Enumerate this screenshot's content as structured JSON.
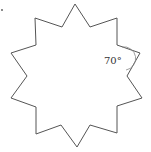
{
  "figure": {
    "type": "star-polygon",
    "points_count": 10,
    "stroke_color": "#555555",
    "background": "#ffffff",
    "angle_label": "70°",
    "vertices": [
      [
        75,
        4
      ],
      [
        90,
        27
      ],
      [
        117,
        18
      ],
      [
        117,
        45
      ],
      [
        140,
        53
      ],
      [
        127,
        76
      ],
      [
        142,
        98
      ],
      [
        117,
        106
      ],
      [
        117,
        133
      ],
      [
        90,
        125
      ],
      [
        77,
        147
      ],
      [
        61,
        125
      ],
      [
        36,
        134
      ],
      [
        36,
        107
      ],
      [
        11,
        98
      ],
      [
        27,
        76
      ],
      [
        11,
        53
      ],
      [
        36,
        45
      ],
      [
        35,
        18
      ],
      [
        62,
        27
      ]
    ]
  }
}
